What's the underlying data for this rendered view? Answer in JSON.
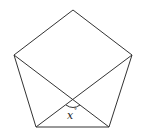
{
  "diagram": {
    "shape": "regular pentagon",
    "vertices": {
      "top": [
        73,
        10
      ],
      "upper_right": [
        132,
        55
      ],
      "lower_right": [
        109,
        127
      ],
      "lower_left": [
        36,
        127
      ],
      "upper_left": [
        14,
        55
      ]
    },
    "diagonals": [
      [
        "upper_left",
        "lower_right"
      ],
      [
        "upper_right",
        "lower_left"
      ]
    ],
    "intersection": [
      73,
      100
    ],
    "angle_label": {
      "variable": "x",
      "unit": "°"
    },
    "colors": {
      "stroke": "#333333",
      "background": "#ffffff"
    }
  }
}
